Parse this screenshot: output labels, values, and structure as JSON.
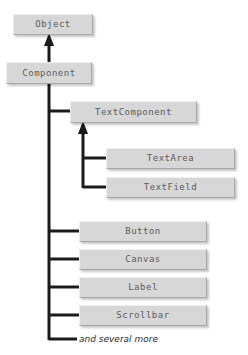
{
  "diagram": {
    "type": "class-hierarchy",
    "background_color": "#ffffff",
    "box_fill_color": "#d7d7d7",
    "box_text_color": "#5b5b5b",
    "connector_color": "#1a1a1a",
    "nodes": [
      {
        "id": "object",
        "label": "Object",
        "x": 13,
        "y": 14,
        "w": 80,
        "h": 21
      },
      {
        "id": "component",
        "label": "Component",
        "x": 6,
        "y": 62,
        "w": 86,
        "h": 22
      },
      {
        "id": "textcomponent",
        "label": "TextComponent",
        "x": 70,
        "y": 101,
        "w": 127,
        "h": 22
      },
      {
        "id": "textarea",
        "label": "TextArea",
        "x": 106,
        "y": 148,
        "w": 129,
        "h": 21
      },
      {
        "id": "textfield",
        "label": "TextField",
        "x": 106,
        "y": 177,
        "w": 129,
        "h": 21
      },
      {
        "id": "button",
        "label": "Button",
        "x": 79,
        "y": 221,
        "w": 128,
        "h": 21
      },
      {
        "id": "canvas",
        "label": "Canvas",
        "x": 79,
        "y": 249,
        "w": 128,
        "h": 21
      },
      {
        "id": "label",
        "label": "Label",
        "x": 79,
        "y": 277,
        "w": 128,
        "h": 21
      },
      {
        "id": "scrollbar",
        "label": "Scrollbar",
        "x": 79,
        "y": 305,
        "w": 128,
        "h": 21
      }
    ],
    "footnote": {
      "text": "and several more",
      "x": 79,
      "y": 334
    },
    "edges": [
      {
        "from": "component",
        "to": "object",
        "kind": "inheritance-arrow"
      },
      {
        "from": "textcomponent",
        "to": "component",
        "kind": "inheritance-branch"
      },
      {
        "from": "textarea",
        "to": "textcomponent",
        "kind": "inheritance-branch"
      },
      {
        "from": "textfield",
        "to": "textcomponent",
        "kind": "inheritance-branch"
      },
      {
        "from": "button",
        "to": "component",
        "kind": "inheritance-branch"
      },
      {
        "from": "canvas",
        "to": "component",
        "kind": "inheritance-branch"
      },
      {
        "from": "label",
        "to": "component",
        "kind": "inheritance-branch"
      },
      {
        "from": "scrollbar",
        "to": "component",
        "kind": "inheritance-branch"
      },
      {
        "from": "more",
        "to": "component",
        "kind": "inheritance-branch"
      }
    ]
  }
}
